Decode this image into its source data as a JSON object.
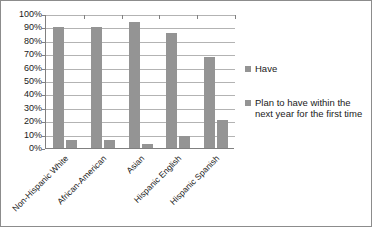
{
  "chart_data": {
    "type": "bar",
    "title": "",
    "xlabel": "",
    "ylabel": "",
    "ylim": [
      0,
      100
    ],
    "ytick_labels": [
      "100%",
      "90%",
      "80%",
      "70%",
      "60%",
      "50%",
      "40%",
      "30%",
      "20%",
      "10%",
      "0%"
    ],
    "ytick_values": [
      100,
      90,
      80,
      70,
      60,
      50,
      40,
      30,
      20,
      10,
      0
    ],
    "grid": true,
    "legend_position": "right",
    "categories": [
      "Non-Hispanic White",
      "African-American",
      "Asian",
      "Hispanic English",
      "Hispanic Spanish"
    ],
    "series": [
      {
        "name": "Have",
        "values": [
          90,
          90,
          94,
          86,
          68
        ]
      },
      {
        "name": "Plan to have within the next year for the first time",
        "values": [
          6,
          6,
          3,
          9,
          21
        ]
      }
    ],
    "colors": {
      "bar": "#949494",
      "gridline": "#b3b3b3",
      "axis": "#808080",
      "frame": "#8c8c8c",
      "text": "#1a1a1a"
    }
  },
  "legend": {
    "entries": [
      {
        "label": "Have"
      },
      {
        "label": "Plan to have within the next year for the first time"
      }
    ]
  }
}
